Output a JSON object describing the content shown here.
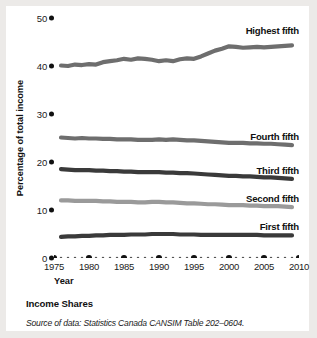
{
  "chart_data": {
    "type": "line",
    "title": "Income Shares",
    "xlabel": "Year",
    "ylabel": "Percentage of total income",
    "source_note": "Source of data: Statistics Canada CANSIM Table 202–0604.",
    "xlim": [
      1975,
      2010
    ],
    "ylim": [
      0,
      50
    ],
    "yticks": [
      0,
      10,
      20,
      30,
      40,
      50
    ],
    "xticks": [
      1975,
      1980,
      1985,
      1990,
      1995,
      2000,
      2005,
      2010
    ],
    "grid": false,
    "legend": "inline-right",
    "x": [
      1976,
      1977,
      1978,
      1979,
      1980,
      1981,
      1982,
      1983,
      1984,
      1985,
      1986,
      1987,
      1988,
      1989,
      1990,
      1991,
      1992,
      1993,
      1994,
      1995,
      1996,
      1997,
      1998,
      1999,
      2000,
      2001,
      2002,
      2003,
      2004,
      2005,
      2006,
      2007,
      2008,
      2009
    ],
    "series": [
      {
        "name": "Highest fifth",
        "color": "#6e6e6e",
        "values": [
          40.1,
          40.0,
          40.3,
          40.2,
          40.4,
          40.3,
          40.8,
          41.0,
          41.2,
          41.5,
          41.3,
          41.6,
          41.5,
          41.3,
          41.0,
          41.2,
          41.0,
          41.4,
          41.6,
          41.5,
          42.0,
          42.6,
          43.2,
          43.6,
          44.1,
          44.0,
          43.8,
          43.9,
          44.0,
          43.9,
          44.0,
          44.1,
          44.2,
          44.3
        ]
      },
      {
        "name": "Fourth fifth",
        "color": "#6e6e6e",
        "values": [
          25.1,
          25.0,
          24.9,
          25.0,
          24.9,
          24.9,
          24.8,
          24.8,
          24.7,
          24.7,
          24.7,
          24.6,
          24.6,
          24.6,
          24.7,
          24.6,
          24.7,
          24.6,
          24.5,
          24.5,
          24.4,
          24.3,
          24.2,
          24.1,
          24.0,
          24.0,
          24.0,
          23.9,
          23.9,
          23.8,
          23.8,
          23.7,
          23.6,
          23.5
        ]
      },
      {
        "name": "Third fifth",
        "color": "#3a3a3a",
        "values": [
          18.5,
          18.4,
          18.3,
          18.3,
          18.3,
          18.2,
          18.2,
          18.1,
          18.1,
          18.0,
          18.0,
          17.9,
          17.9,
          17.9,
          17.9,
          17.8,
          17.8,
          17.7,
          17.7,
          17.6,
          17.5,
          17.4,
          17.3,
          17.2,
          17.1,
          17.1,
          17.0,
          17.0,
          16.9,
          16.8,
          16.8,
          16.7,
          16.6,
          16.5
        ]
      },
      {
        "name": "Second fifth",
        "color": "#9a9a9a",
        "values": [
          12.0,
          12.0,
          11.9,
          11.9,
          11.9,
          11.9,
          11.8,
          11.8,
          11.7,
          11.7,
          11.7,
          11.6,
          11.6,
          11.7,
          11.7,
          11.6,
          11.6,
          11.5,
          11.4,
          11.4,
          11.3,
          11.2,
          11.2,
          11.1,
          11.0,
          11.0,
          11.0,
          10.9,
          10.9,
          10.8,
          10.8,
          10.8,
          10.7,
          10.6
        ]
      },
      {
        "name": "First fifth",
        "color": "#3a3a3a",
        "values": [
          4.4,
          4.5,
          4.5,
          4.6,
          4.6,
          4.7,
          4.7,
          4.8,
          4.8,
          4.8,
          4.9,
          4.9,
          4.9,
          5.0,
          5.0,
          5.0,
          5.0,
          4.9,
          4.9,
          4.9,
          4.8,
          4.8,
          4.8,
          4.8,
          4.8,
          4.8,
          4.8,
          4.8,
          4.8,
          4.7,
          4.7,
          4.7,
          4.7,
          4.7
        ]
      }
    ]
  },
  "axis": {
    "ytick_labels": [
      "50",
      "40",
      "30",
      "20",
      "10",
      "0"
    ],
    "xtick_labels": [
      "1975",
      "1980",
      "1985",
      "1990",
      "1995",
      "2000",
      "2005",
      "2010"
    ]
  }
}
